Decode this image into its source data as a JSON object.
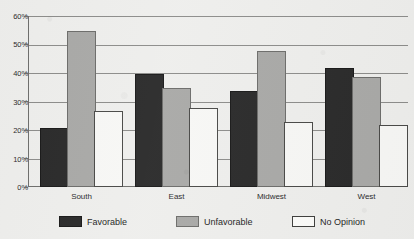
{
  "chart_data": {
    "type": "bar",
    "title": "",
    "xlabel": "",
    "ylabel": "",
    "ylim": [
      0,
      60
    ],
    "ytick_labels": [
      "0%",
      "10%",
      "20%",
      "30%",
      "40%",
      "50%",
      "60%"
    ],
    "ytick_values": [
      0,
      10,
      20,
      30,
      40,
      50,
      60
    ],
    "grid": true,
    "legend_position": "bottom",
    "categories": [
      "South",
      "East",
      "Midwest",
      "West"
    ],
    "series": [
      {
        "name": "Favorable",
        "color": "#2b2b2b",
        "values": [
          20,
          39,
          33,
          41
        ]
      },
      {
        "name": "Unfavorable",
        "color": "#a9a9a7",
        "values": [
          54,
          34,
          47,
          38
        ]
      },
      {
        "name": "No Opinion",
        "color": "#f7f7f5",
        "values": [
          26,
          27,
          22,
          21
        ]
      }
    ]
  },
  "legend": {
    "items": [
      {
        "label": "Favorable"
      },
      {
        "label": "Unfavorable"
      },
      {
        "label": "No Opinion"
      }
    ]
  }
}
